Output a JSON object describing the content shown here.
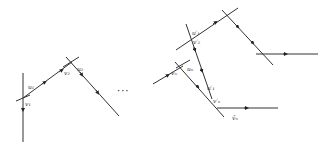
{
  "diagram": {
    "type": "polygonal-path-with-crossings",
    "width": 329,
    "height": 147,
    "line_color": "#333333",
    "ellipsis": "···",
    "labels": {
      "u1": "u₁",
      "v1": "v₁",
      "v2": "v₂",
      "u2": "u₂",
      "vn": "vₙ",
      "un": "uₙ",
      "u1p": "u′₁",
      "v2p": "v′₂",
      "u1pp": "u′₁",
      "vnp": "v′ₙ",
      "vn_tilde": "ṽₙ"
    }
  }
}
